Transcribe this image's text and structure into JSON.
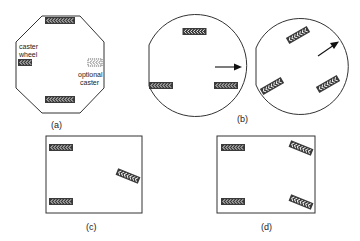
{
  "figure": {
    "panels": [
      {
        "id": "a",
        "caption": "(a)",
        "shape": "octagon",
        "labels": {
          "caster_line1": "caster",
          "caster_line2": "wheel",
          "optional_line1": "optional",
          "optional_line2": "caster"
        },
        "wheels": [
          "top drive wheel",
          "bottom drive wheel",
          "left caster wheel",
          "right optional caster"
        ]
      },
      {
        "id": "b",
        "caption": "(b)",
        "shape": "two circles",
        "wheels": [
          "three wheels, straight",
          "three wheels, rotated"
        ],
        "arrows": [
          "heading right",
          "heading up-right"
        ]
      },
      {
        "id": "c",
        "caption": "(c)",
        "shape": "rectangle",
        "wheels": [
          "top-left",
          "bottom-left",
          "right steered wheel"
        ]
      },
      {
        "id": "d",
        "caption": "(d)",
        "shape": "rectangle",
        "wheels": [
          "top-left",
          "bottom-left",
          "top-right steered",
          "bottom-right steered"
        ]
      }
    ]
  }
}
